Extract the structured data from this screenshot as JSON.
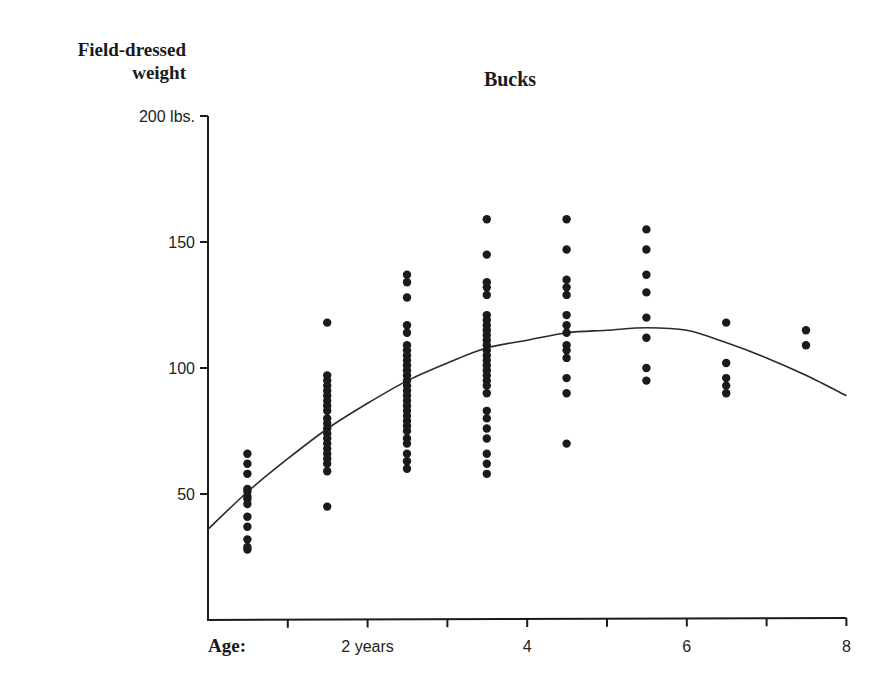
{
  "chart_data": {
    "type": "scatter",
    "title": "Bucks",
    "ylabel": "Field-dressed weight",
    "ylabel_lines": [
      "Field-dressed",
      "weight"
    ],
    "xlabel": "Age:",
    "xlim": [
      0,
      8
    ],
    "ylim": [
      0,
      200
    ],
    "y_ticks": [
      {
        "value": 200,
        "label": "200 lbs."
      },
      {
        "value": 150,
        "label": "150"
      },
      {
        "value": 100,
        "label": "100"
      },
      {
        "value": 50,
        "label": "50"
      }
    ],
    "x_ticks": [
      {
        "value": 1,
        "label": ""
      },
      {
        "value": 2,
        "label": "2 years"
      },
      {
        "value": 3,
        "label": ""
      },
      {
        "value": 4,
        "label": "4"
      },
      {
        "value": 5,
        "label": ""
      },
      {
        "value": 6,
        "label": "6"
      },
      {
        "value": 7,
        "label": ""
      },
      {
        "value": 8,
        "label": "8"
      }
    ],
    "grid": false,
    "legend": null,
    "series": [
      {
        "name": "Observed weights",
        "kind": "scatter",
        "points": [
          {
            "age": 0.5,
            "weights": [
              66,
              62,
              58,
              52,
              51,
              49,
              48,
              46,
              41,
              37,
              32,
              29,
              28
            ]
          },
          {
            "age": 1.5,
            "weights": [
              118,
              97,
              95,
              93,
              91,
              89,
              87,
              85,
              83,
              80,
              78,
              76,
              74,
              72,
              70,
              68,
              66,
              64,
              62,
              59,
              45
            ]
          },
          {
            "age": 2.5,
            "weights": [
              137,
              134,
              128,
              117,
              114,
              109,
              107,
              105,
              103,
              101,
              99,
              97,
              95,
              93,
              91,
              89,
              87,
              85,
              83,
              81,
              79,
              77,
              75,
              72,
              70,
              66,
              63,
              60
            ]
          },
          {
            "age": 3.5,
            "weights": [
              159,
              145,
              134,
              132,
              129,
              121,
              119,
              117,
              115,
              113,
              111,
              109,
              107,
              105,
              103,
              101,
              99,
              97,
              95,
              93,
              90,
              83,
              80,
              76,
              72,
              66,
              62,
              58
            ]
          },
          {
            "age": 4.5,
            "weights": [
              159,
              147,
              135,
              132,
              129,
              121,
              117,
              114,
              109,
              107,
              104,
              96,
              90,
              70
            ]
          },
          {
            "age": 5.5,
            "weights": [
              155,
              147,
              137,
              130,
              120,
              112,
              100,
              95
            ]
          },
          {
            "age": 6.5,
            "weights": [
              118,
              102,
              96,
              93,
              90
            ]
          },
          {
            "age": 7.5,
            "weights": [
              115,
              109
            ]
          }
        ]
      },
      {
        "name": "Fitted curve",
        "kind": "line",
        "x": [
          0,
          0.5,
          1,
          1.5,
          2,
          2.5,
          3,
          3.5,
          4,
          4.5,
          5,
          5.5,
          6,
          6.5,
          7,
          7.5,
          8
        ],
        "y": [
          36,
          51,
          64,
          76,
          86,
          95,
          102,
          108,
          111,
          114,
          115,
          116,
          115,
          110,
          104,
          97,
          89
        ]
      }
    ]
  },
  "page": {
    "title": "Bucks",
    "ylabel_line1": "Field-dressed",
    "ylabel_line2": "weight",
    "xlabel": "Age:"
  },
  "style": {
    "ink": "#1a1a1a",
    "background": "#ffffff"
  }
}
